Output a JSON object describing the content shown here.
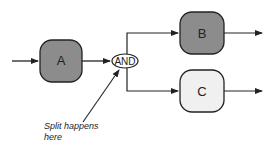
{
  "diagram": {
    "nodes": [
      {
        "id": "A",
        "label": "A",
        "fill": "#8c8c8c"
      },
      {
        "id": "B",
        "label": "B",
        "fill": "#8c8c8c"
      },
      {
        "id": "C",
        "label": "C",
        "fill": "#f0f0f0"
      }
    ],
    "gateway": {
      "label": "AND"
    },
    "annotation": {
      "line1": "Split happens",
      "line2": "here"
    }
  }
}
